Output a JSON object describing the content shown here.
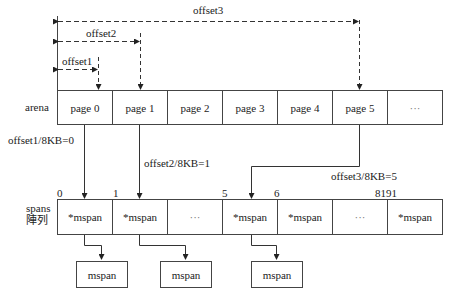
{
  "offsets": {
    "offset1": "offset1",
    "offset2": "offset2",
    "offset3": "offset3"
  },
  "arena": {
    "label": "arena",
    "pages": [
      "page 0",
      "page 1",
      "page 2",
      "page 3",
      "page 4",
      "page 5",
      "···"
    ]
  },
  "mappings": {
    "m1": "offset1/8KB=0",
    "m2": "offset2/8KB=1",
    "m3": "offset3/8KB=5"
  },
  "spans": {
    "label_line1": "spans",
    "label_line2": "陣列",
    "indices": {
      "i0": "0",
      "i1": "1",
      "i5": "5",
      "i6": "6",
      "ilast": "8191"
    },
    "cells": [
      "*mspan",
      "*mspan",
      "···",
      "*mspan",
      "*mspan",
      "···",
      "*mspan"
    ]
  },
  "mspan_boxes": [
    "mspan",
    "mspan",
    "mspan"
  ]
}
